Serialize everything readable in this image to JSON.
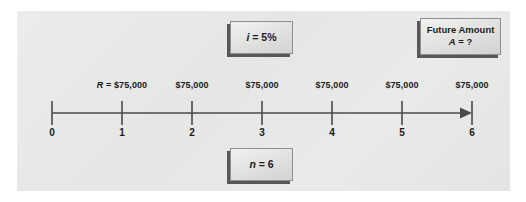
{
  "diagram": {
    "type": "cash-flow-timeline",
    "background_color": "#e8e8e6",
    "line_color": "#4a4a4a"
  },
  "callouts": {
    "interest": {
      "symbol": "i",
      "equals": " = ",
      "value": "5%",
      "text": "i = 5%"
    },
    "periods": {
      "symbol": "n",
      "equals": " = ",
      "value": "6",
      "text": "n = 6"
    },
    "future": {
      "title": "Future Amount",
      "symbol": "A",
      "equals": " = ",
      "value": "?",
      "text": "A = ?"
    }
  },
  "timeline": {
    "axis": {
      "start_period": 0,
      "end_period": 6,
      "arrow": "right"
    },
    "period_labels": [
      "0",
      "1",
      "2",
      "3",
      "4",
      "5",
      "6"
    ],
    "cash_flows": [
      {
        "period": 1,
        "prefix": "R",
        "equals": " = ",
        "amount": "$75,000",
        "text": "R = $75,000"
      },
      {
        "period": 2,
        "prefix": "",
        "equals": "",
        "amount": "$75,000",
        "text": "$75,000"
      },
      {
        "period": 3,
        "prefix": "",
        "equals": "",
        "amount": "$75,000",
        "text": "$75,000"
      },
      {
        "period": 4,
        "prefix": "",
        "equals": "",
        "amount": "$75,000",
        "text": "$75,000"
      },
      {
        "period": 5,
        "prefix": "",
        "equals": "",
        "amount": "$75,000",
        "text": "$75,000"
      },
      {
        "period": 6,
        "prefix": "",
        "equals": "",
        "amount": "$75,000",
        "text": "$75,000"
      }
    ]
  }
}
